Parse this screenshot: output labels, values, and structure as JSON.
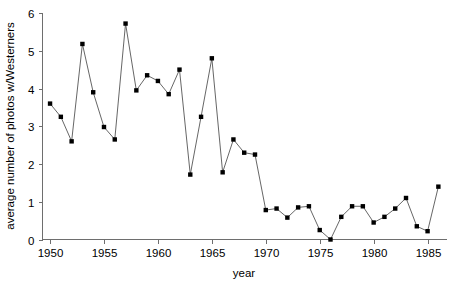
{
  "chart_data": {
    "type": "line",
    "title": "",
    "subtitle": "",
    "xlabel": "year",
    "ylabel": "average number of photos w/Westerners",
    "xlim": [
      1949.3,
      1986.8
    ],
    "ylim": [
      0,
      6
    ],
    "xticks": [
      1950,
      1955,
      1960,
      1965,
      1970,
      1975,
      1980,
      1985
    ],
    "xtick_labels": [
      "1950",
      "1955",
      "1960",
      "1965",
      "1970",
      "1975",
      "1980",
      "1985"
    ],
    "yticks": [
      0,
      1,
      2,
      3,
      4,
      5,
      6
    ],
    "ytick_labels": [
      "0",
      "1",
      "2",
      "3",
      "4",
      "5",
      "6"
    ],
    "grid": false,
    "legend": false,
    "marker": "square",
    "marker_color": "#000000",
    "line_color": "#555555",
    "axis_color": "#6e6e6e",
    "x": [
      1950,
      1951,
      1952,
      1953,
      1954,
      1955,
      1956,
      1957,
      1958,
      1959,
      1960,
      1961,
      1962,
      1963,
      1964,
      1965,
      1966,
      1967,
      1968,
      1969,
      1970,
      1971,
      1972,
      1973,
      1974,
      1975,
      1976,
      1977,
      1978,
      1979,
      1980,
      1981,
      1982,
      1983,
      1984,
      1985,
      1986
    ],
    "values": [
      3.6,
      3.25,
      2.6,
      5.18,
      3.9,
      2.98,
      2.65,
      5.72,
      3.95,
      4.35,
      4.2,
      3.85,
      4.5,
      1.72,
      3.25,
      4.8,
      1.78,
      2.65,
      2.3,
      2.25,
      0.78,
      0.82,
      0.58,
      0.85,
      0.88,
      0.25,
      0.0,
      0.6,
      0.88,
      0.88,
      0.45,
      0.6,
      0.82,
      1.1,
      0.35,
      0.22,
      1.4
    ],
    "series": [
      {
        "name": "average number of photos w/Westerners",
        "values": [
          3.6,
          3.25,
          2.6,
          5.18,
          3.9,
          2.98,
          2.65,
          5.72,
          3.95,
          4.35,
          4.2,
          3.85,
          4.5,
          1.72,
          3.25,
          4.8,
          1.78,
          2.65,
          2.3,
          2.25,
          0.78,
          0.82,
          0.58,
          0.85,
          0.88,
          0.25,
          0.0,
          0.6,
          0.88,
          0.88,
          0.45,
          0.6,
          0.82,
          1.1,
          0.35,
          0.22,
          1.4
        ]
      }
    ]
  }
}
